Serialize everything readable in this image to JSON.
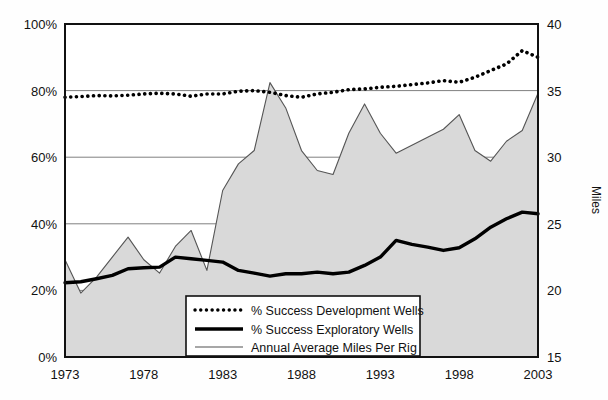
{
  "chart_data": {
    "type": "line",
    "title": "",
    "subtitle": "",
    "xlabel": "",
    "ylabel": "",
    "ylabel_right": "Miles",
    "grid": true,
    "legend_position": "bottom-center",
    "x": [
      1973,
      1974,
      1975,
      1976,
      1977,
      1978,
      1979,
      1980,
      1981,
      1982,
      1983,
      1984,
      1985,
      1986,
      1987,
      1988,
      1989,
      1990,
      1991,
      1992,
      1993,
      1994,
      1995,
      1996,
      1997,
      1998,
      1999,
      2000,
      2001,
      2002,
      2003
    ],
    "xlim": [
      1973,
      2003
    ],
    "xticks": [
      1973,
      1978,
      1983,
      1988,
      1993,
      1998,
      2003
    ],
    "xticklabels": [
      "1973",
      "1978",
      "1983",
      "1988",
      "1993",
      "1998",
      "2003"
    ],
    "ylim_left": [
      0,
      100
    ],
    "yticks_left": [
      0,
      20,
      40,
      60,
      80,
      100
    ],
    "yticklabels_left": [
      "0%",
      "20%",
      "40%",
      "60%",
      "80%",
      "100%"
    ],
    "ylim_right": [
      15,
      40
    ],
    "yticks_right": [
      15,
      20,
      25,
      30,
      35,
      40
    ],
    "yticklabels_right": [
      "15",
      "20",
      "25",
      "30",
      "35",
      "40"
    ],
    "series": [
      {
        "name": "% Success Development Wells",
        "axis": "left",
        "style": "dotted",
        "color": "#000000",
        "unit": "%",
        "values": [
          78,
          78.2,
          78.5,
          78.4,
          78.6,
          79,
          79.2,
          79,
          78.3,
          79,
          79,
          79.8,
          80,
          79.5,
          78.5,
          78,
          79,
          79.5,
          80.3,
          80.5,
          81,
          81.3,
          81.8,
          82.3,
          83,
          82.5,
          84,
          86,
          88,
          92,
          90
        ]
      },
      {
        "name": "% Success Exploratory Wells",
        "axis": "left",
        "style": "solid-thick",
        "color": "#000000",
        "unit": "%",
        "values": [
          22.3,
          22.6,
          23.5,
          24.5,
          26.5,
          26.8,
          27,
          30,
          29.5,
          29,
          28.5,
          26,
          25.2,
          24.3,
          25,
          25,
          25.5,
          25,
          25.5,
          27.5,
          30,
          35,
          33.8,
          33,
          32,
          32.8,
          35.5,
          39,
          41.5,
          43.5,
          43
        ]
      },
      {
        "name": "Annual Average Miles Per Rig",
        "axis": "right",
        "style": "area",
        "color": "#808080",
        "fill": "#d9d9d9",
        "unit": "miles",
        "values": [
          22.3,
          19.8,
          21,
          22.5,
          24.0,
          22.3,
          21.3,
          23.3,
          24.5,
          21.5,
          27.5,
          29.5,
          30.5,
          35.6,
          33.7,
          30.5,
          29,
          28.7,
          31.8,
          34,
          31.8,
          30.3,
          30.9,
          31.5,
          32.1,
          33.2,
          30.5,
          29.7,
          31.2,
          32,
          34.8
        ]
      }
    ]
  },
  "axes": {
    "left": {
      "ticks": [
        "100%",
        "80%",
        "60%",
        "40%",
        "20%",
        "0%"
      ]
    },
    "right": {
      "ticks": [
        "40",
        "35",
        "30",
        "25",
        "20",
        "15"
      ],
      "title": "Miles"
    },
    "bottom": {
      "ticks": [
        "1973",
        "1978",
        "1983",
        "1988",
        "1993",
        "1998",
        "2003"
      ]
    }
  },
  "legend": {
    "items": [
      {
        "label": "% Success Development Wells",
        "marker": "dotted-line"
      },
      {
        "label": "% Success Exploratory Wells",
        "marker": "thick-solid-line"
      },
      {
        "label": "Annual Average Miles Per Rig",
        "marker": "thin-gray-line"
      }
    ]
  },
  "colors": {
    "plot_background": "#ffffff",
    "page_background": "#fefefe",
    "frame": "#111111",
    "gridline": "#808080",
    "area_fill": "#d9d9d9",
    "area_stroke": "#555555",
    "dotted_series": "#000000",
    "thick_series": "#000000"
  }
}
